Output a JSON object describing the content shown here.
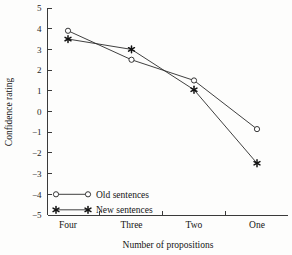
{
  "chart_data": {
    "type": "line",
    "title": "",
    "xlabel": "Number of propositions",
    "ylabel": "Confidence rating",
    "categories": [
      "Four",
      "Three",
      "Two",
      "One"
    ],
    "ylim": [
      -5,
      5
    ],
    "yticks": [
      5,
      4,
      3,
      2,
      1,
      0,
      -1,
      -2,
      -3,
      -4,
      -5
    ],
    "ytick_labels": [
      "5",
      "4",
      "3",
      "2",
      "1",
      "0",
      "−1",
      "−2",
      "−3",
      "−4",
      "−5"
    ],
    "grid": false,
    "legend_position": "lower-left-inside",
    "series": [
      {
        "name": "Old sentences",
        "marker": "open-circle",
        "values": [
          3.9,
          2.5,
          1.5,
          -0.85
        ]
      },
      {
        "name": "New sentences",
        "marker": "filled-star",
        "values": [
          3.5,
          3.0,
          1.05,
          -2.5
        ]
      }
    ]
  },
  "legend": {
    "entries": [
      {
        "label": "Old sentences",
        "marker": "open-circle"
      },
      {
        "label": "New sentences",
        "marker": "filled-star"
      }
    ]
  },
  "colors": {
    "line": "#2a2a2a",
    "axis": "#3a3a3a",
    "text": "#141414",
    "background": "#fdfdfc"
  }
}
